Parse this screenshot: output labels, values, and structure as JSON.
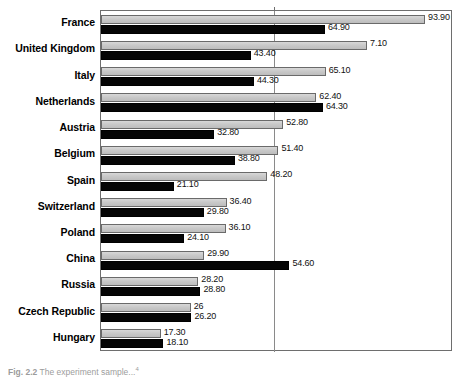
{
  "chart_data": {
    "type": "bar",
    "orientation": "horizontal",
    "title": "",
    "xlabel": "",
    "ylabel": "",
    "xlim": [
      0,
      102
    ],
    "grid": true,
    "gridlines": [
      50
    ],
    "legend": "none",
    "value_label_decimals": 2,
    "categories": [
      "France",
      "United Kingdom",
      "Italy",
      "Netherlands",
      "Austria",
      "Belgium",
      "Spain",
      "Switzerland",
      "Poland",
      "China",
      "Russia",
      "Czech Republic",
      "Hungary"
    ],
    "series": [
      {
        "name": "series-a",
        "color": "#c9c9c9",
        "values": [
          93.9,
          77.1,
          65.1,
          62.4,
          52.8,
          51.4,
          48.2,
          36.4,
          36.1,
          29.9,
          28.2,
          26.0,
          17.3
        ],
        "labels": [
          "93.90",
          "7.10",
          "65.10",
          "62.40",
          "52.80",
          "51.40",
          "48.20",
          "36.40",
          "36.10",
          "29.90",
          "28.20",
          "26",
          "17.30"
        ]
      },
      {
        "name": "series-b",
        "color": "#050505",
        "values": [
          64.9,
          43.4,
          44.3,
          64.3,
          32.8,
          38.8,
          21.1,
          29.8,
          24.1,
          54.6,
          28.8,
          26.2,
          18.1
        ],
        "labels": [
          "64.90",
          "43.40",
          "44.30",
          "64.30",
          "32.80",
          "38.80",
          "21.10",
          "29.80",
          "24.10",
          "54.60",
          "28.80",
          "26.20",
          "18.10"
        ]
      }
    ]
  },
  "caption": {
    "figure_number": "Fig. 2.2",
    "text": "The experiment sample...",
    "superscript": "4"
  }
}
